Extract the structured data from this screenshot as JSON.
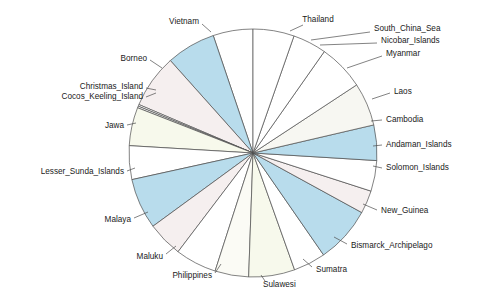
{
  "chart_data": {
    "type": "pie",
    "title": "",
    "subtitle": "",
    "xlabel": "",
    "ylabel": "",
    "legend_position": "none",
    "grid": false,
    "label_style": "leader-lines around perimeter",
    "start_angle_deg": 90,
    "direction": "counterclockwise",
    "center": {
      "x": 253,
      "y": 153
    },
    "radius": 124,
    "categories": [
      "Thailand",
      "Vietnam",
      "Borneo",
      "Christmas_Island",
      "Cocos_Keeling_Island",
      "Jawa",
      "Lesser_Sunda_Islands",
      "Malaya",
      "Maluku",
      "Philippines",
      "Sulawesi",
      "Sumatra",
      "Bismarck_Archipelago",
      "New_Guinea",
      "Solomon_Islands",
      "Andaman_Islands",
      "Cambodia",
      "Laos",
      "Myanmar",
      "Nicobar_Islands",
      "South_China_Sea"
    ],
    "values": [
      5.2,
      6.4,
      7.0,
      0.22,
      0.22,
      5.0,
      4.4,
      6.6,
      4.6,
      5.4,
      4.4,
      6.0,
      4.2,
      7.4,
      3.0,
      4.0,
      4.6,
      5.6,
      6.0,
      4.4,
      5.2
    ],
    "value_unit": "percent of total",
    "slices": [
      {
        "label": "Thailand",
        "value": 5.2,
        "color": "#ffffff",
        "start_deg": 90.0,
        "end_deg": 108.7
      },
      {
        "label": "Vietnam",
        "value": 6.4,
        "color": "#b8dcec",
        "start_deg": 108.7,
        "end_deg": 131.8
      },
      {
        "label": "Borneo",
        "value": 7.0,
        "color": "#f5efef",
        "start_deg": 131.8,
        "end_deg": 157.0
      },
      {
        "label": "Christmas_Island",
        "value": 0.22,
        "color": "#ffffff",
        "start_deg": 157.0,
        "end_deg": 157.8
      },
      {
        "label": "Cocos_Keeling_Island",
        "value": 0.22,
        "color": "#ffffff",
        "start_deg": 157.8,
        "end_deg": 158.6
      },
      {
        "label": "Jawa",
        "value": 5.0,
        "color": "#f7f9ec",
        "start_deg": 158.6,
        "end_deg": 176.6
      },
      {
        "label": "Lesser_Sunda_Islands",
        "value": 4.4,
        "color": "#ffffff",
        "start_deg": 176.6,
        "end_deg": 192.4
      },
      {
        "label": "Malaya",
        "value": 6.6,
        "color": "#b8dcec",
        "start_deg": 192.4,
        "end_deg": 216.2
      },
      {
        "label": "Maluku",
        "value": 4.6,
        "color": "#f5efef",
        "start_deg": 216.2,
        "end_deg": 232.8
      },
      {
        "label": "Philippines",
        "value": 5.4,
        "color": "#ffffff",
        "start_deg": 232.8,
        "end_deg": 252.2
      },
      {
        "label": "Sulawesi",
        "value": 4.4,
        "color": "#fbfbf5",
        "start_deg": 252.2,
        "end_deg": 268.0
      },
      {
        "label": "Sumatra",
        "value": 6.0,
        "color": "#f7f9ec",
        "start_deg": 268.0,
        "end_deg": 289.6
      },
      {
        "label": "Bismarck_Archipelago",
        "value": 4.2,
        "color": "#ffffff",
        "start_deg": 289.6,
        "end_deg": 304.7
      },
      {
        "label": "New_Guinea",
        "value": 7.4,
        "color": "#b8dcec",
        "start_deg": 304.7,
        "end_deg": 331.3
      },
      {
        "label": "Solomon_Islands",
        "value": 3.0,
        "color": "#f5efef",
        "start_deg": 331.3,
        "end_deg": 342.1
      },
      {
        "label": "Andaman_Islands",
        "value": 4.0,
        "color": "#ffffff",
        "start_deg": 342.1,
        "end_deg": 356.5
      },
      {
        "label": "Cambodia",
        "value": 4.6,
        "color": "#b8dcec",
        "start_deg": 356.5,
        "end_deg": 373.1
      },
      {
        "label": "Laos",
        "value": 5.6,
        "color": "#f7f7f2",
        "start_deg": 373.1,
        "end_deg": 393.3
      },
      {
        "label": "Myanmar",
        "value": 6.0,
        "color": "#ffffff",
        "start_deg": 393.3,
        "end_deg": 414.9
      },
      {
        "label": "Nicobar_Islands",
        "value": 4.4,
        "color": "#ffffff",
        "start_deg": 414.9,
        "end_deg": 430.7
      },
      {
        "label": "South_China_Sea",
        "value": 5.2,
        "color": "#ffffff",
        "start_deg": 430.7,
        "end_deg": 450.0
      }
    ],
    "labels": [
      {
        "text": "Thailand",
        "x": 318,
        "y": 20,
        "anchor": "mid",
        "lx1": 303,
        "ly1": 25,
        "lx2": 290,
        "ly2": 31
      },
      {
        "text": "South_China_Sea",
        "x": 374,
        "y": 29,
        "anchor": "start",
        "lx1": 370,
        "ly1": 32,
        "lx2": 311,
        "ly2": 40
      },
      {
        "text": "Nicobar_Islands",
        "x": 381,
        "y": 41,
        "anchor": "start",
        "lx1": 377,
        "ly1": 43,
        "lx2": 320,
        "ly2": 45
      },
      {
        "text": "Myanmar",
        "x": 386,
        "y": 54,
        "anchor": "start",
        "lx1": 382,
        "ly1": 56,
        "lx2": 347,
        "ly2": 68
      },
      {
        "text": "Laos",
        "x": 394,
        "y": 92,
        "anchor": "start",
        "lx1": 390,
        "ly1": 93,
        "lx2": 372,
        "ly2": 99
      },
      {
        "text": "Cambodia",
        "x": 386,
        "y": 120,
        "anchor": "start",
        "lx1": 382,
        "ly1": 120,
        "lx2": 371,
        "ly2": 121
      },
      {
        "text": "Andaman_Islands",
        "x": 386,
        "y": 145,
        "anchor": "start",
        "lx1": 382,
        "ly1": 145,
        "lx2": 373,
        "ly2": 146
      },
      {
        "text": "Solomon_Islands",
        "x": 386,
        "y": 168,
        "anchor": "start",
        "lx1": 382,
        "ly1": 168,
        "lx2": 373,
        "ly2": 166
      },
      {
        "text": "New_Guinea",
        "x": 381,
        "y": 211,
        "anchor": "start",
        "lx1": 377,
        "ly1": 210,
        "lx2": 363,
        "ly2": 204
      },
      {
        "text": "Bismarck_Archipelago",
        "x": 351,
        "y": 246,
        "anchor": "start",
        "lx1": 347,
        "ly1": 244,
        "lx2": 334,
        "ly2": 237
      },
      {
        "text": "Sumatra",
        "x": 316,
        "y": 270,
        "anchor": "start",
        "lx1": 312,
        "ly1": 267,
        "lx2": 303,
        "ly2": 259
      },
      {
        "text": "Sulawesi",
        "x": 263,
        "y": 285,
        "anchor": "start",
        "lx1": 265,
        "ly1": 281,
        "lx2": 261,
        "ly2": 275
      },
      {
        "text": "Philippines",
        "x": 212,
        "y": 276,
        "anchor": "end",
        "lx1": 215,
        "ly1": 273,
        "lx2": 221,
        "ly2": 264
      },
      {
        "text": "Maluku",
        "x": 163,
        "y": 257,
        "anchor": "end",
        "lx1": 166,
        "ly1": 254,
        "lx2": 176,
        "ly2": 246
      },
      {
        "text": "Malaya",
        "x": 131,
        "y": 220,
        "anchor": "end",
        "lx1": 134,
        "ly1": 218,
        "lx2": 148,
        "ly2": 212
      },
      {
        "text": "Lesser_Sunda_Islands",
        "x": 124,
        "y": 172,
        "anchor": "end",
        "lx1": 127,
        "ly1": 171,
        "lx2": 135,
        "ly2": 168
      },
      {
        "text": "Jawa",
        "x": 124,
        "y": 126,
        "anchor": "end",
        "lx1": 127,
        "ly1": 125,
        "lx2": 136,
        "ly2": 123
      },
      {
        "text": "Cocos_Keeling_Island",
        "x": 143,
        "y": 97,
        "anchor": "end",
        "lx1": 146,
        "ly1": 97,
        "lx2": 156,
        "ly2": 93
      },
      {
        "text": "Christmas_Island",
        "x": 143,
        "y": 87,
        "anchor": "end",
        "lx1": 146,
        "ly1": 88,
        "lx2": 156,
        "ly2": 90
      },
      {
        "text": "Borneo",
        "x": 147,
        "y": 59,
        "anchor": "end",
        "lx1": 150,
        "ly1": 60,
        "lx2": 162,
        "ly2": 68
      },
      {
        "text": "Vietnam",
        "x": 199,
        "y": 22,
        "anchor": "end",
        "lx1": 202,
        "ly1": 24,
        "lx2": 211,
        "ly2": 32
      }
    ]
  },
  "colors": {
    "blue_fill": "#b8dcec",
    "pink_fill": "#f5efef",
    "cream_fill": "#f7f9ec",
    "white_fill": "#ffffff",
    "stroke": "#4d4d4d",
    "text": "#1a1a1a",
    "background": "#ffffff"
  }
}
